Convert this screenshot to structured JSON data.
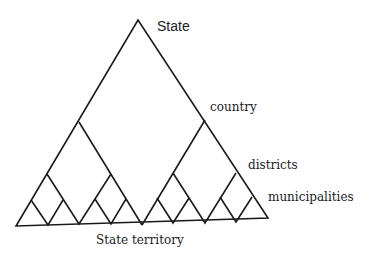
{
  "diagram": {
    "type": "hierarchical-triangle",
    "labels": {
      "state": "State",
      "country": "country",
      "districts": "districts",
      "municipalities": "municipalities",
      "base": "State territory"
    },
    "levels": [
      "State",
      "country",
      "districts",
      "municipalities"
    ],
    "colors": {
      "stroke": "#1a1a1a",
      "background": "#ffffff"
    }
  }
}
